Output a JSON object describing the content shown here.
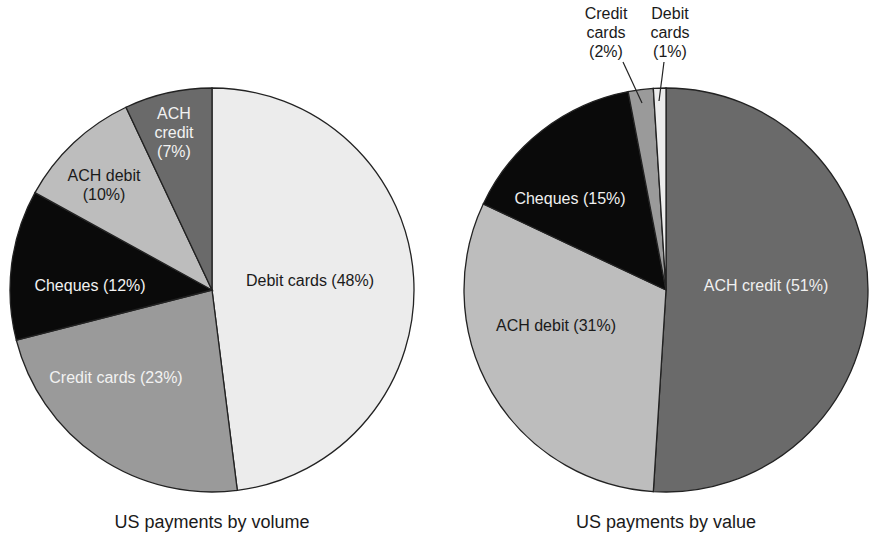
{
  "colors": {
    "debit_cards": "#ececec",
    "credit_cards": "#9a9a9a",
    "cheques": "#0a0a0a",
    "ach_debit": "#bdbdbd",
    "ach_credit": "#6a6a6a",
    "outline": "#222222"
  },
  "chart_data": [
    {
      "type": "pie",
      "title": "US payments by volume",
      "categories": [
        "Debit cards",
        "Credit cards",
        "Cheques",
        "ACH debit",
        "ACH credit"
      ],
      "values": [
        48,
        23,
        12,
        10,
        7
      ],
      "unit": "%",
      "labels": {
        "debit_cards": "Debit cards (48%)",
        "credit_cards": "Credit cards (23%)",
        "cheques": "Cheques (12%)",
        "ach_debit_l1": "ACH debit",
        "ach_debit_l2": "(10%)",
        "ach_credit_l1": "ACH",
        "ach_credit_l2": "credit",
        "ach_credit_l3": "(7%)"
      }
    },
    {
      "type": "pie",
      "title": "US payments by value",
      "categories": [
        "ACH credit",
        "ACH debit",
        "Cheques",
        "Credit cards",
        "Debit cards"
      ],
      "values": [
        51,
        31,
        15,
        2,
        1
      ],
      "unit": "%",
      "labels": {
        "ach_credit": "ACH credit (51%)",
        "ach_debit": "ACH debit (31%)",
        "cheques": "Cheques (15%)",
        "credit_cards_l1": "Credit",
        "credit_cards_l2": "cards",
        "credit_cards_l3": "(2%)",
        "debit_cards_l1": "Debit",
        "debit_cards_l2": "cards",
        "debit_cards_l3": "(1%)"
      }
    }
  ]
}
